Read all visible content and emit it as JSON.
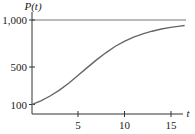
{
  "chart_data": {
    "type": "line",
    "title": "",
    "xlabel": "t",
    "ylabel": "P(t)",
    "xlim": [
      0,
      17
    ],
    "ylim": [
      0,
      1000
    ],
    "grid": false,
    "legend": null,
    "x_ticks": [
      5,
      10,
      15
    ],
    "x_tick_labels": [
      "5",
      "10",
      "15"
    ],
    "y_ticks": [
      100,
      500,
      1000
    ],
    "y_tick_labels": [
      "100",
      "500",
      "1,000"
    ],
    "annotations": [
      {
        "type": "horizontal-line",
        "y": 1000,
        "description": "carrying capacity asymptote"
      }
    ],
    "series": [
      {
        "name": "P(t)",
        "description": "logistic growth curve, P(t) ≈ 1000 / (1 + 9e^(-0.38t))",
        "x": [
          0,
          1,
          2,
          3,
          4,
          5,
          6,
          7,
          8,
          9,
          10,
          11,
          12,
          13,
          14,
          15,
          16,
          16.5
        ],
        "values": [
          100,
          140,
          191,
          254,
          328,
          410,
          494,
          576,
          651,
          718,
          773,
          818,
          853,
          881,
          904,
          921,
          935,
          941
        ]
      }
    ]
  },
  "labels": {
    "y_axis": "P(t)",
    "x_axis": "t",
    "y_100": "100",
    "y_500": "500",
    "y_1000": "1,000",
    "x_5": "5",
    "x_10": "10",
    "x_15": "15"
  },
  "colors": {
    "axis": "#333333",
    "curve": "#666666",
    "asymptote": "#777777"
  }
}
